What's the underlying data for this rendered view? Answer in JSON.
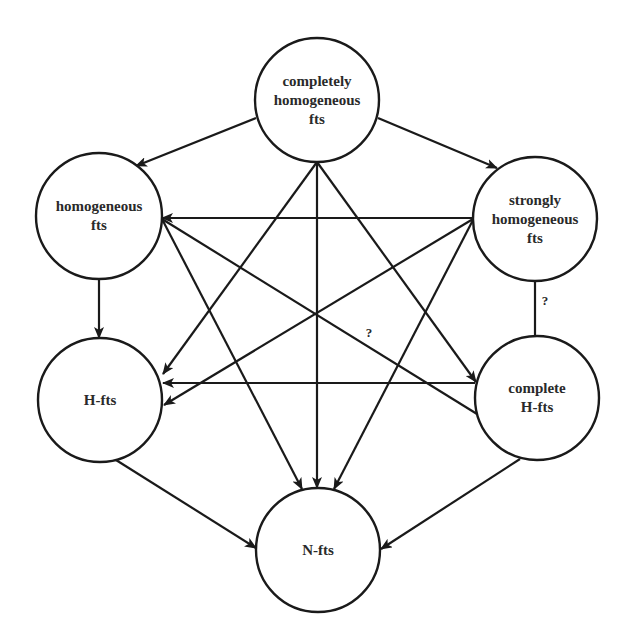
{
  "diagram": {
    "type": "directed-graph",
    "stroke_color": "#1a1a1a",
    "nodes": [
      {
        "id": "completely",
        "label_lines": [
          "completely",
          "homogeneous",
          "fts"
        ],
        "cx": 317,
        "cy": 100,
        "r": 62
      },
      {
        "id": "homogeneous",
        "label_lines": [
          "homogeneous",
          "fts"
        ],
        "cx": 99,
        "cy": 216,
        "r": 63
      },
      {
        "id": "strongly",
        "label_lines": [
          "strongly",
          "homogeneous",
          "fts"
        ],
        "cx": 535,
        "cy": 219,
        "r": 62
      },
      {
        "id": "hfts",
        "label_lines": [
          "H-fts"
        ],
        "cx": 100,
        "cy": 400,
        "r": 62
      },
      {
        "id": "complete-hfts",
        "label_lines": [
          "complete",
          "H-fts"
        ],
        "cx": 537,
        "cy": 398,
        "r": 62
      },
      {
        "id": "nfts",
        "label_lines": [
          "N-fts"
        ],
        "cx": 318,
        "cy": 550,
        "r": 62
      }
    ],
    "edges": [
      {
        "from": "completely",
        "to": "homogeneous",
        "arrow": true,
        "x1": 256,
        "y1": 118,
        "x2": 136,
        "y2": 166
      },
      {
        "from": "completely",
        "to": "strongly",
        "arrow": true,
        "x1": 378,
        "y1": 118,
        "x2": 497,
        "y2": 168
      },
      {
        "from": "completely",
        "to": "hfts",
        "arrow": true,
        "x1": 317,
        "y1": 162,
        "x2": 163,
        "y2": 374
      },
      {
        "from": "completely",
        "to": "nfts",
        "arrow": true,
        "x1": 317,
        "y1": 162,
        "x2": 317,
        "y2": 488
      },
      {
        "from": "completely",
        "to": "complete-hfts",
        "arrow": true,
        "x1": 317,
        "y1": 162,
        "x2": 476,
        "y2": 382
      },
      {
        "from": "strongly",
        "to": "homogeneous",
        "arrow": true,
        "x1": 473,
        "y1": 218,
        "x2": 162,
        "y2": 218
      },
      {
        "from": "strongly",
        "to": "hfts",
        "arrow": true,
        "x1": 473,
        "y1": 219,
        "x2": 164,
        "y2": 405
      },
      {
        "from": "strongly",
        "to": "nfts",
        "arrow": true,
        "x1": 473,
        "y1": 220,
        "x2": 334,
        "y2": 489
      },
      {
        "from": "strongly",
        "to": "complete-hfts",
        "arrow": false,
        "label": "?",
        "x1": 535,
        "y1": 281,
        "x2": 535,
        "y2": 336
      },
      {
        "from": "homogeneous",
        "to": "hfts",
        "arrow": true,
        "x1": 99,
        "y1": 279,
        "x2": 99,
        "y2": 338
      },
      {
        "from": "homogeneous",
        "to": "nfts",
        "arrow": true,
        "x1": 162,
        "y1": 219,
        "x2": 302,
        "y2": 489
      },
      {
        "from": "homogeneous",
        "to": "complete-hfts",
        "arrow": false,
        "label": "?",
        "x1": 162,
        "y1": 219,
        "x2": 477,
        "y2": 414
      },
      {
        "from": "complete-hfts",
        "to": "hfts",
        "arrow": true,
        "x1": 475,
        "y1": 383,
        "x2": 163,
        "y2": 383
      },
      {
        "from": "hfts",
        "to": "nfts",
        "arrow": true,
        "x1": 116,
        "y1": 460,
        "x2": 256,
        "y2": 548
      },
      {
        "from": "complete-hfts",
        "to": "nfts",
        "arrow": true,
        "x1": 520,
        "y1": 459,
        "x2": 381,
        "y2": 549
      }
    ],
    "edge_labels": [
      {
        "text": "?",
        "x": 545,
        "y": 301
      },
      {
        "text": "?",
        "x": 369,
        "y": 333
      }
    ]
  }
}
